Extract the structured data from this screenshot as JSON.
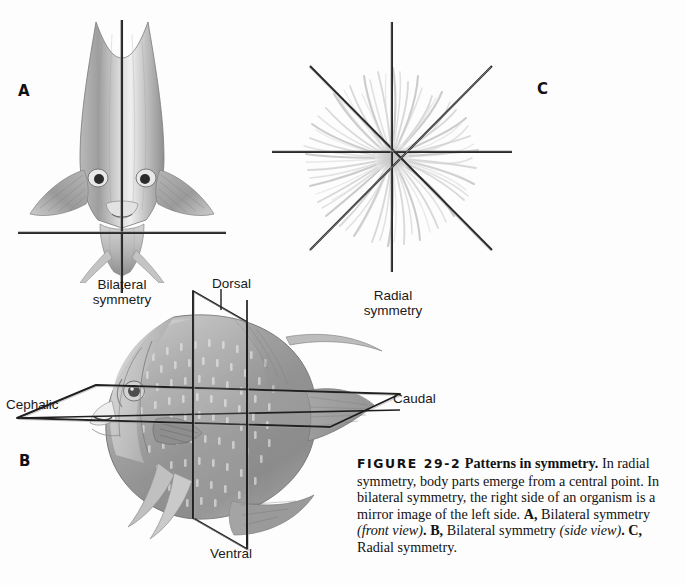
{
  "figure": {
    "number": "FIGURE 29-2",
    "title": "Patterns in symmetry.",
    "body": " In radial symmetry, body parts emerge from a central point. In bilateral symmetry, the right side of an organism is a mirror image of the left side. ",
    "partA_letter": "A,",
    "partA_text": " Bilateral symmetry ",
    "partA_italic": "(front view)",
    "partB_letter": ". B,",
    "partB_text": " Bilateral symmetry ",
    "partB_italic": "(side view)",
    "partC_letter": ". C,",
    "partC_text": " Radial symmetry."
  },
  "panels": {
    "a": {
      "letter": "A",
      "caption": "Bilateral\nsymmetry",
      "subject": "angelfish-front-view"
    },
    "b": {
      "letter": "B",
      "subject": "angelfish-side-view",
      "labels": {
        "dorsal": "Dorsal",
        "ventral": "Ventral",
        "cephalic": "Cephalic",
        "caudal": "Caudal"
      }
    },
    "c": {
      "letter": "C",
      "caption": "Radial\nsymmetry",
      "subject": "sea-anemone-top-view"
    }
  },
  "colors": {
    "background": "#fdfdfd",
    "line": "#1c1c1c",
    "text": "#121212",
    "fish_body_light": "#cfcfcf",
    "fish_body_mid": "#a8a8a8",
    "fish_body_dark": "#7d7d7d",
    "anemone_tentacle": "#c8c8c8"
  }
}
